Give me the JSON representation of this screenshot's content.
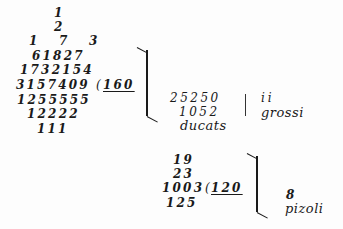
{
  "document": {
    "first_division": {
      "galley_rows": [
        {
          "text": "1",
          "left": 54,
          "top": 7
        },
        {
          "text": "2",
          "left": 54,
          "top": 21
        },
        {
          "text": "1    7    3",
          "left": 30,
          "top": 35
        },
        {
          "text": "61827",
          "left": 32,
          "top": 50
        },
        {
          "text": "1732154",
          "left": 20,
          "top": 64
        },
        {
          "text": "3157409",
          "left": 16,
          "top": 79
        },
        {
          "text": "1255555",
          "left": 17,
          "top": 94
        },
        {
          "text": "12222",
          "left": 27,
          "top": 108
        },
        {
          "text": "111",
          "left": 37,
          "top": 123
        }
      ],
      "divisor_paren": "(",
      "divisor": "160",
      "result": {
        "ducats_rows": [
          "25250",
          "1052"
        ],
        "ducats_label": "ducats",
        "grossi_value": "ii",
        "grossi_label": "grossi"
      }
    },
    "second_division": {
      "galley_rows": [
        {
          "text": "19",
          "left": 173,
          "top": 154
        },
        {
          "text": "23",
          "left": 173,
          "top": 168
        },
        {
          "text": "1003",
          "left": 162,
          "top": 182
        },
        {
          "text": "125",
          "left": 166,
          "top": 197
        }
      ],
      "divisor_paren": "(",
      "divisor": "120",
      "result": {
        "pizoli_value": "8",
        "pizoli_label": "pizoli"
      }
    }
  }
}
